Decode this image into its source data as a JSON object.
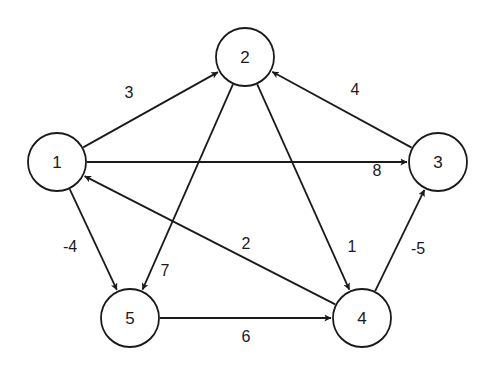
{
  "graph": {
    "type": "directed-weighted",
    "colors": {
      "stroke": "#1a1a1a",
      "background": "#ffffff",
      "node_fill": "#ffffff"
    },
    "node_radius": 29,
    "nodes": [
      {
        "id": "1",
        "label": "1",
        "x": 57,
        "y": 162
      },
      {
        "id": "2",
        "label": "2",
        "x": 245,
        "y": 57
      },
      {
        "id": "3",
        "label": "3",
        "x": 438,
        "y": 162
      },
      {
        "id": "4",
        "label": "4",
        "x": 362,
        "y": 318
      },
      {
        "id": "5",
        "label": "5",
        "x": 130,
        "y": 318
      }
    ],
    "edges": [
      {
        "from": "1",
        "to": "2",
        "weight": "3",
        "label_x": 129,
        "label_y": 92
      },
      {
        "from": "1",
        "to": "3",
        "weight": "8",
        "label_x": 377,
        "label_y": 170
      },
      {
        "from": "1",
        "to": "5",
        "weight": "-4",
        "label_x": 70,
        "label_y": 246
      },
      {
        "from": "2",
        "to": "5",
        "weight": "7",
        "label_x": 165,
        "label_y": 270
      },
      {
        "from": "2",
        "to": "4",
        "weight": "1",
        "label_x": 352,
        "label_y": 246
      },
      {
        "from": "3",
        "to": "2",
        "weight": "4",
        "label_x": 355,
        "label_y": 89
      },
      {
        "from": "4",
        "to": "1",
        "weight": "2",
        "label_x": 246,
        "label_y": 243
      },
      {
        "from": "4",
        "to": "3",
        "weight": "-5",
        "label_x": 418,
        "label_y": 248
      },
      {
        "from": "5",
        "to": "4",
        "weight": "6",
        "label_x": 246,
        "label_y": 336
      }
    ]
  }
}
